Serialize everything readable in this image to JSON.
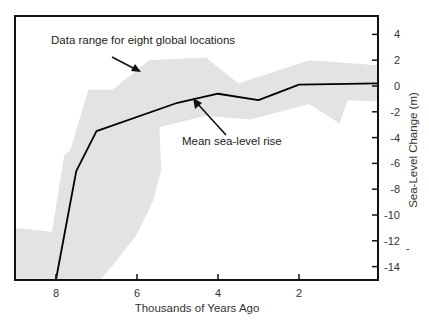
{
  "chart_data": {
    "type": "line",
    "title": "",
    "xlabel": "Thousands of Years Ago",
    "ylabel": "Sea-Level Change (m)",
    "xlim": [
      9.0,
      0.0
    ],
    "ylim": [
      -15,
      5.5
    ],
    "x_ticks": [
      8,
      6,
      4,
      2
    ],
    "x_tick_labels": [
      "8",
      "6",
      "4",
      "2"
    ],
    "y_ticks": [
      4,
      2,
      0,
      -2,
      -4,
      -6,
      -8,
      -10,
      -12,
      -14
    ],
    "y_tick_labels": [
      "4",
      "2",
      "0",
      "-2",
      "-4",
      "-6",
      "-8",
      "-10",
      "-12",
      "-14"
    ],
    "y_axis_position": "right",
    "grid": false,
    "series": [
      {
        "name": "Mean sea-level rise",
        "kind": "line",
        "color": "#000000",
        "x": [
          8.0,
          7.5,
          7.0,
          5.0,
          4.0,
          3.0,
          2.0,
          0.0
        ],
        "y": [
          -15.0,
          -6.6,
          -3.5,
          -1.3,
          -0.6,
          -1.1,
          0.1,
          0.2
        ]
      },
      {
        "name": "Data range for eight global locations",
        "kind": "band",
        "color": "#e3e3e3",
        "upper": {
          "x": [
            9.0,
            8.1,
            7.8,
            7.65,
            7.2,
            6.6,
            5.7,
            4.3,
            3.5,
            1.75,
            0.0
          ],
          "y": [
            -11.0,
            -11.3,
            -5.4,
            -5.0,
            -0.3,
            -0.3,
            2.0,
            2.2,
            0.2,
            2.0,
            1.6
          ]
        },
        "lower": {
          "x": [
            9.0,
            6.9,
            6.5,
            6.0,
            5.6,
            5.4,
            5.45,
            4.3,
            3.2,
            1.75,
            1.0,
            0.8,
            0.0
          ],
          "y": [
            -15.0,
            -15.0,
            -13.5,
            -11.5,
            -8.9,
            -6.5,
            -3.2,
            -2.3,
            -2.6,
            -1.4,
            -2.9,
            -1.1,
            -1.2
          ]
        }
      }
    ],
    "annotations": [
      {
        "text": "Data range for eight global locations",
        "arrow_to": [
          6.0,
          1.2
        ]
      },
      {
        "text": "Mean sea-level rise",
        "arrow_to": [
          4.7,
          -1.1
        ]
      }
    ]
  },
  "labels": {
    "xlabel": "Thousands of Years Ago",
    "ylabel": "Sea-Level Change (m)",
    "annotation_range": "Data range for eight global locations",
    "annotation_mean": "Mean sea-level rise",
    "stray_mark": "-"
  }
}
